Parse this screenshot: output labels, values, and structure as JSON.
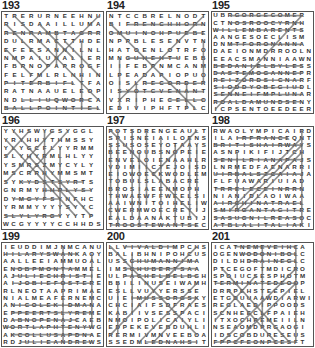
{
  "puzzles": [
    {
      "number": "193",
      "rows": [
        "TRERURNEEHNU",
        "RISDAAILLUMA",
        "RENRAMBTAGRR",
        "DULRMACTTHDE",
        "EFEESANNILNL",
        "NMPAIUNALIER",
        "FBRNOPAPROGF",
        "FELFMLRLNHIN",
        "PITERBIFLTFA",
        "RATNAAUELEOP",
        "NDLLIUQWORCA",
        "BALLPOINTIEL"
      ],
      "lines": [
        [
          0,
          2,
          11,
          2
        ],
        [
          0,
          8,
          8,
          8
        ],
        [
          2,
          10,
          10,
          10
        ],
        [
          0,
          11,
          11,
          11
        ],
        [
          1,
          0,
          11,
          10
        ],
        [
          0,
          1,
          5,
          6
        ],
        [
          11,
          0,
          3,
          8
        ],
        [
          9,
          3,
          9,
          11
        ],
        [
          0,
          4,
          3,
          7
        ],
        [
          4,
          1,
          8,
          5
        ],
        [
          6,
          2,
          6,
          6
        ],
        [
          7,
          3,
          11,
          7
        ]
      ]
    },
    {
      "number": "194",
      "rows": [
        "NTCCBRELNODT",
        "BIFRENCHHORN",
        "OMUINOHPUEBE",
        "NPPBLESENVTN",
        "HATOENLOTRFO",
        "MNGUHEHTUEBB",
        "IIFEBPNMCANM",
        "LPEADAPIOPUO",
        "OISLRECORDER",
        "ISYOTCVENANT",
        "VXRIPHECELLO",
        "EDIVIPHFTPLC"
      ],
      "lines": [
        [
          2,
          1,
          11,
          1
        ],
        [
          0,
          2,
          11,
          2
        ],
        [
          2,
          5,
          8,
          5
        ],
        [
          4,
          8,
          11,
          8
        ],
        [
          1,
          9,
          11,
          9
        ],
        [
          7,
          10,
          11,
          10
        ],
        [
          0,
          1,
          10,
          11
        ],
        [
          11,
          0,
          1,
          10
        ],
        [
          1,
          5,
          1,
          11
        ],
        [
          3,
          8,
          3,
          11
        ],
        [
          11,
          3,
          11,
          8
        ],
        [
          9,
          8,
          9,
          11
        ]
      ]
    },
    {
      "number": "195",
      "rows": [
        "UBRGORGECOMER",
        "CTNOSROOCYRNH",
        "WILLEMBARENTS",
        "AANGESOECLISM",
        "DNMTFORONANNA",
        "DAEIONMDRROOLN",
        "EEACSMANNIAAWN",
        "BEDANIELBYLESS",
        "DASTEMOGANNEPR",
        "REIZORDSICNARF",
        "SIODDYOBEGIUDL",
        "SENNEIFMPLUNAR",
        "ROALDAMUNDSENY",
        "ICPSENTOEEDEER"
      ],
      "lines": [
        [
          2,
          0,
          12,
          0
        ],
        [
          2,
          1,
          12,
          1
        ],
        [
          0,
          2,
          12,
          2
        ],
        [
          2,
          4,
          12,
          4
        ],
        [
          0,
          7,
          12,
          7
        ],
        [
          0,
          8,
          12,
          8
        ],
        [
          0,
          9,
          12,
          9
        ],
        [
          0,
          10,
          12,
          10
        ],
        [
          0,
          11,
          12,
          11
        ],
        [
          0,
          12,
          12,
          12
        ],
        [
          12,
          0,
          0,
          13
        ],
        [
          0,
          13,
          0,
          13
        ]
      ]
    },
    {
      "number": "196",
      "rows": [
        "YYHSWYGSYGGL",
        "YRYHHYTHMSSY",
        "YLYGCFLYYRMM",
        "SLYHYRMLHLYY",
        "YSMRSZMYCYLY",
        "MSCRRHYMMSMT",
        "SYKYDSTSYRTS",
        "GNRMYHHPLYSY",
        "DYMGYFSYNFHC",
        "YRMMYYYYSYYC",
        "SLYLYRGYYYTP",
        "WCGYYYYCCHHDS"
      ],
      "lines": [
        [
          0,
          10,
          7,
          10
        ],
        [
          2,
          6,
          10,
          6
        ],
        [
          5,
          7,
          11,
          7
        ],
        [
          1,
          8,
          7,
          8
        ],
        [
          0,
          1,
          9,
          10
        ],
        [
          1,
          0,
          11,
          10
        ],
        [
          3,
          0,
          0,
          3
        ],
        [
          8,
          0,
          3,
          5
        ],
        [
          7,
          2,
          7,
          10
        ],
        [
          5,
          0,
          5,
          8
        ],
        [
          0,
          6,
          6,
          0
        ],
        [
          9,
          9,
          3,
          3
        ]
      ]
    },
    {
      "number": "197",
      "rows": [
        "POTSDRENGEAULT",
        "SPISNEIAILOENS",
        "SSUSOSEYOTAAYS",
        "BEENOUBSNOPEIE",
        "ENVELOIENAAHLR",
        "VDIMIICTEJOISD",
        "EIOWOECKWODLEM",
        "TOBULSLABACRE",
        "BROSIAEENMOPH",
        "THWAEWFFWEELSI",
        "AAIWNITOIHELIW",
        "CWERMWOECREYIJ",
        "EALDAANAKTUBIJ",
        "TROOSTEWANTSEC"
      ],
      "lines": [
        [
          0,
          13,
          12,
          13
        ],
        [
          0,
          0,
          12,
          12
        ],
        [
          12,
          0,
          6,
          6
        ],
        [
          1,
          0,
          1,
          13
        ],
        [
          3,
          0,
          3,
          12
        ],
        [
          5,
          0,
          5,
          10
        ],
        [
          7,
          1,
          7,
          12
        ],
        [
          9,
          2,
          9,
          13
        ],
        [
          11,
          1,
          11,
          12
        ],
        [
          12,
          2,
          12,
          11
        ],
        [
          0,
          2,
          0,
          12
        ],
        [
          4,
          3,
          4,
          13
        ]
      ]
    },
    {
      "number": "198",
      "rows": [
        "RWAOLYMPICAIRD",
        "ILAIRFRANCEQNT",
        "BRITISHAIRWAYS",
        "ASNPIKIFIJTCH",
        "SENILRIANAPAJS",
        "LNRMEDFAENARRI",
        "UIRBALSZCAIAJA",
        "FLFUAWARIUIAD",
        "TRRELECEINRRN",
        "NIANIDLAOIWAA",
        "AIRCHINATRAEL",
        "SMIRGANTAGITRE",
        "SASUGNILREASOC",
        "ATBLALITALIAKI"
      ],
      "lines": [
        [
          3,
          1,
          10,
          1
        ],
        [
          0,
          2,
          12,
          2
        ],
        [
          0,
          4,
          12,
          4
        ],
        [
          0,
          6,
          12,
          6
        ],
        [
          0,
          8,
          12,
          8
        ],
        [
          0,
          10,
          12,
          10
        ],
        [
          0,
          11,
          12,
          11
        ],
        [
          0,
          12,
          12,
          12
        ],
        [
          0,
          13,
          12,
          13
        ],
        [
          12,
          1,
          2,
          11
        ],
        [
          12,
          2,
          3,
          11
        ],
        [
          12,
          3,
          4,
          11
        ],
        [
          12,
          0,
          12,
          13
        ],
        [
          3,
          3,
          3,
          11
        ]
      ]
    },
    {
      "number": "199",
      "rows": [
        "IEUDDIMJNMCANU",
        "HILARYSWANKAOY",
        "AALLEEIAMMUOAL",
        "ENOBPMONTAMMEL",
        "AJULIECHRISTIE",
        "AIJOBIEFOSTERE",
        "RLNEOTAAPRIMAE",
        "NIALMEAFERNEMC",
        "ANICOLEKIDMANA",
        "EPPEERTSLYREME",
        "DABNOPENAJCAEB",
        "WORTLAPHTENYWG",
        "AKCOLLUSAPDNAE",
        "RDJULIEANDREWS"
      ],
      "lines": [
        [
          0,
          1,
          10,
          1
        ],
        [
          1,
          3,
          10,
          3
        ],
        [
          1,
          4,
          12,
          4
        ],
        [
          1,
          5,
          12,
          5
        ],
        [
          1,
          8,
          12,
          8
        ],
        [
          1,
          9,
          12,
          9
        ],
        [
          1,
          10,
          10,
          10
        ],
        [
          0,
          11,
          12,
          11
        ],
        [
          1,
          12,
          12,
          12
        ],
        [
          2,
          13,
          12,
          13
        ],
        [
          8,
          0,
          8,
          13
        ],
        [
          12,
          1,
          12,
          11
        ]
      ]
    },
    {
      "number": "200",
      "rows": [
        "LLVIVALDIMPCHS",
        "BALIBHNIPOHCUS",
        "USSCHUMANNIMA",
        "IMSCHUBERTSAA",
        "ULPACHELBELBGH",
        "BBILINUSEIWAMH",
        "ESLLVUYYERSSE",
        "UIEIMUSSORGSKY",
        "CHCIAIFSDFRAES",
        "KABIIVSESSPACI",
        "NMOIPOLICAIYLI",
        "EDPEKEVEBDUHLI",
        "RERMIVMNVEEBOA",
        "SSEDMLEDNAHSIT"
      ],
      "lines": [
        [
          2,
          0,
          9,
          0
        ],
        [
          3,
          2,
          12,
          2
        ],
        [
          2,
          3,
          12,
          3
        ],
        [
          2,
          4,
          12,
          4
        ],
        [
          3,
          7,
          12,
          7
        ],
        [
          5,
          13,
          12,
          13
        ],
        [
          0,
          0,
          12,
          12
        ],
        [
          12,
          0,
          0,
          12
        ],
        [
          1,
          5,
          1,
          12
        ],
        [
          3,
          1,
          3,
          9
        ],
        [
          12,
          5,
          4,
          13
        ],
        [
          12,
          7,
          6,
          13
        ]
      ]
    },
    {
      "number": "201",
      "rows": [
        "ICATNEMEVEIHCA",
        "OGENWODONIBOLC",
        "DILDHDRAINEGLC",
        "PTCEGOFTMDICRO",
        "SPOIUCSESPHOTM",
        "TERMINATEDEOOP",
        "DRRPEHSTEEPIEL",
        "ETGDUUAAWDIARWI",
        "REGLAEDIPPOODS",
        "SCNHEECLFPAIEH",
        "ITXOCHPEMEIILN",
        "NSEAOMDPRGAOGI",
        "IDSCOBDURESEUS",
        "FPPCFEONPCESFT"
      ],
      "lines": [
        [
          3,
          0,
          12,
          0
        ],
        [
          4,
          1,
          12,
          1
        ],
        [
          5,
          2,
          12,
          2
        ],
        [
          0,
          5,
          12,
          5
        ],
        [
          7,
          0,
          7,
          11
        ],
        [
          0,
          13,
          12,
          13
        ],
        [
          12,
          3,
          1,
          13
        ],
        [
          12,
          5,
          3,
          13
        ],
        [
          1,
          3,
          11,
          13
        ],
        [
          2,
          6,
          9,
          13
        ],
        [
          12,
          0,
          12,
          13
        ],
        [
          6,
          4,
          0,
          10
        ]
      ]
    }
  ],
  "colors": {
    "grid_border": "#555555",
    "letter": "#333333",
    "strike_line": "#6b6b6b",
    "background": "#ffffff"
  }
}
